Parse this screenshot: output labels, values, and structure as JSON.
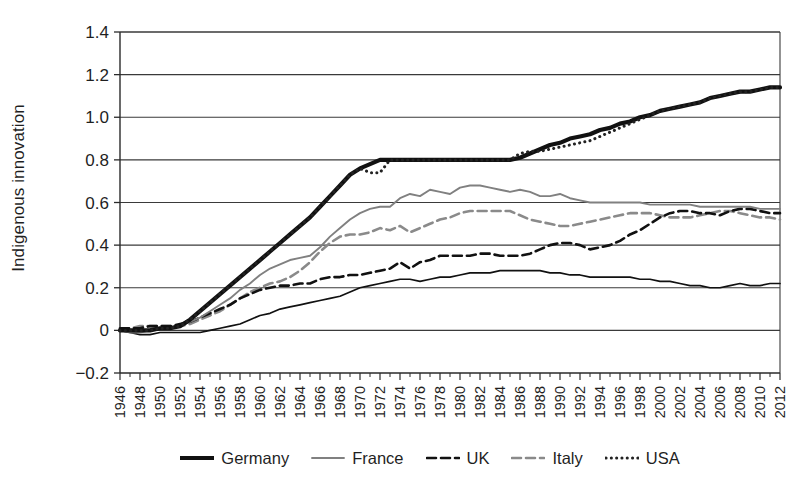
{
  "figure": {
    "ylabel": "Indigenous innovation",
    "y_ticks": [
      "1.4",
      "1.2",
      "1.0",
      "0.8",
      "0.6",
      "0.4",
      "0.2",
      "0",
      "−0.2"
    ],
    "legend": [
      {
        "name": "germany",
        "label": "Germany",
        "style": "solid-thick",
        "color": "#111111"
      },
      {
        "name": "france",
        "label": "France",
        "style": "solid-thin",
        "color": "#808080"
      },
      {
        "name": "uk",
        "label": "UK",
        "style": "dashed",
        "color": "#111111"
      },
      {
        "name": "italy",
        "label": "Italy",
        "style": "dashed",
        "color": "#8a8a8a"
      },
      {
        "name": "usa",
        "label": "USA",
        "style": "dotted",
        "color": "#222222"
      }
    ]
  },
  "chart_data": {
    "type": "line",
    "title": "",
    "xlabel": "",
    "ylabel": "Indigenous innovation",
    "xlim": [
      1946,
      2012
    ],
    "ylim": [
      -0.2,
      1.4
    ],
    "ytick_step": 0.2,
    "grid": "horizontal",
    "legend_position": "bottom",
    "x_tick_step": 2,
    "x": [
      1946,
      1947,
      1948,
      1949,
      1950,
      1951,
      1952,
      1953,
      1954,
      1955,
      1956,
      1957,
      1958,
      1959,
      1960,
      1961,
      1962,
      1963,
      1964,
      1965,
      1966,
      1967,
      1968,
      1969,
      1970,
      1971,
      1972,
      1973,
      1974,
      1975,
      1976,
      1977,
      1978,
      1979,
      1980,
      1981,
      1982,
      1983,
      1984,
      1985,
      1986,
      1987,
      1988,
      1989,
      1990,
      1991,
      1992,
      1993,
      1994,
      1995,
      1996,
      1997,
      1998,
      1999,
      2000,
      2001,
      2002,
      2003,
      2004,
      2005,
      2006,
      2007,
      2008,
      2009,
      2010,
      2011,
      2012
    ],
    "x_tick_labels": [
      "1946",
      "1948",
      "1950",
      "1952",
      "1954",
      "1956",
      "1958",
      "1960",
      "1962",
      "1964",
      "1966",
      "1968",
      "1970",
      "1972",
      "1974",
      "1976",
      "1978",
      "1980",
      "1982",
      "1984",
      "1986",
      "1988",
      "1990",
      "1992",
      "1994",
      "1996",
      "1998",
      "2000",
      "2002",
      "2004",
      "2006",
      "2008",
      "2010",
      "2012"
    ],
    "series": [
      {
        "name": "Germany",
        "style": "solid-thick",
        "color": "#111111",
        "values": [
          0.0,
          0.0,
          0.0,
          0.0,
          0.01,
          0.01,
          0.02,
          0.05,
          0.09,
          0.13,
          0.17,
          0.21,
          0.25,
          0.29,
          0.33,
          0.37,
          0.41,
          0.45,
          0.49,
          0.53,
          0.58,
          0.63,
          0.68,
          0.73,
          0.76,
          0.78,
          0.8,
          0.8,
          0.8,
          0.8,
          0.8,
          0.8,
          0.8,
          0.8,
          0.8,
          0.8,
          0.8,
          0.8,
          0.8,
          0.8,
          0.81,
          0.83,
          0.85,
          0.87,
          0.88,
          0.9,
          0.91,
          0.92,
          0.94,
          0.95,
          0.97,
          0.98,
          1.0,
          1.01,
          1.03,
          1.04,
          1.05,
          1.06,
          1.07,
          1.09,
          1.1,
          1.11,
          1.12,
          1.12,
          1.13,
          1.14,
          1.14
        ]
      },
      {
        "name": "France",
        "style": "solid-thin",
        "color": "#808080",
        "values": [
          0.0,
          -0.01,
          -0.01,
          0.0,
          0.01,
          0.01,
          0.02,
          0.04,
          0.06,
          0.09,
          0.12,
          0.15,
          0.19,
          0.22,
          0.26,
          0.29,
          0.31,
          0.33,
          0.34,
          0.35,
          0.39,
          0.44,
          0.48,
          0.52,
          0.55,
          0.57,
          0.58,
          0.58,
          0.62,
          0.64,
          0.63,
          0.66,
          0.65,
          0.64,
          0.67,
          0.68,
          0.68,
          0.67,
          0.66,
          0.65,
          0.66,
          0.65,
          0.63,
          0.63,
          0.64,
          0.62,
          0.61,
          0.6,
          0.6,
          0.6,
          0.6,
          0.6,
          0.6,
          0.59,
          0.59,
          0.59,
          0.59,
          0.59,
          0.58,
          0.58,
          0.58,
          0.58,
          0.58,
          0.58,
          0.57,
          0.57,
          0.57
        ]
      },
      {
        "name": "UK",
        "style": "dashed",
        "color": "#111111",
        "values": [
          0.01,
          0.01,
          0.01,
          0.02,
          0.02,
          0.02,
          0.03,
          0.04,
          0.06,
          0.08,
          0.1,
          0.12,
          0.15,
          0.17,
          0.19,
          0.2,
          0.21,
          0.21,
          0.22,
          0.22,
          0.24,
          0.25,
          0.25,
          0.26,
          0.26,
          0.27,
          0.28,
          0.29,
          0.32,
          0.29,
          0.32,
          0.33,
          0.35,
          0.35,
          0.35,
          0.35,
          0.36,
          0.36,
          0.35,
          0.35,
          0.35,
          0.36,
          0.38,
          0.4,
          0.41,
          0.41,
          0.4,
          0.38,
          0.39,
          0.4,
          0.42,
          0.45,
          0.47,
          0.5,
          0.53,
          0.55,
          0.56,
          0.56,
          0.55,
          0.55,
          0.54,
          0.56,
          0.57,
          0.57,
          0.56,
          0.55,
          0.55
        ]
      },
      {
        "name": "Italy",
        "style": "dashed",
        "color": "#8a8a8a",
        "values": [
          0.01,
          0.01,
          0.02,
          0.02,
          0.02,
          0.02,
          0.02,
          0.03,
          0.05,
          0.07,
          0.09,
          0.12,
          0.15,
          0.18,
          0.2,
          0.22,
          0.23,
          0.25,
          0.28,
          0.32,
          0.37,
          0.41,
          0.44,
          0.45,
          0.45,
          0.46,
          0.48,
          0.47,
          0.49,
          0.46,
          0.48,
          0.5,
          0.52,
          0.53,
          0.55,
          0.56,
          0.56,
          0.56,
          0.56,
          0.56,
          0.54,
          0.52,
          0.51,
          0.5,
          0.49,
          0.49,
          0.5,
          0.51,
          0.52,
          0.53,
          0.54,
          0.55,
          0.55,
          0.55,
          0.54,
          0.53,
          0.53,
          0.53,
          0.54,
          0.55,
          0.56,
          0.56,
          0.55,
          0.54,
          0.53,
          0.53,
          0.52
        ]
      },
      {
        "name": "USA",
        "style": "dotted",
        "color": "#222222",
        "values": [
          0.0,
          0.0,
          0.0,
          0.0,
          0.01,
          0.01,
          0.02,
          0.05,
          0.09,
          0.13,
          0.17,
          0.21,
          0.25,
          0.29,
          0.33,
          0.37,
          0.41,
          0.45,
          0.49,
          0.53,
          0.58,
          0.63,
          0.68,
          0.73,
          0.76,
          0.74,
          0.74,
          0.8,
          0.8,
          0.8,
          0.8,
          0.8,
          0.8,
          0.8,
          0.8,
          0.8,
          0.8,
          0.8,
          0.8,
          0.8,
          0.83,
          0.84,
          0.84,
          0.85,
          0.86,
          0.87,
          0.88,
          0.89,
          0.91,
          0.93,
          0.95,
          0.97,
          0.99,
          1.01,
          1.03,
          1.04,
          1.05,
          1.06,
          1.07,
          1.09,
          1.1,
          1.11,
          1.12,
          1.12,
          1.13,
          1.14,
          1.14
        ]
      },
      {
        "name": "unlabeled-lower",
        "style": "solid-thin-dark",
        "color": "#111111",
        "values": [
          0.0,
          -0.01,
          -0.02,
          -0.02,
          -0.01,
          -0.01,
          -0.01,
          -0.01,
          -0.01,
          0.0,
          0.01,
          0.02,
          0.03,
          0.05,
          0.07,
          0.08,
          0.1,
          0.11,
          0.12,
          0.13,
          0.14,
          0.15,
          0.16,
          0.18,
          0.2,
          0.21,
          0.22,
          0.23,
          0.24,
          0.24,
          0.23,
          0.24,
          0.25,
          0.25,
          0.26,
          0.27,
          0.27,
          0.27,
          0.28,
          0.28,
          0.28,
          0.28,
          0.28,
          0.27,
          0.27,
          0.26,
          0.26,
          0.25,
          0.25,
          0.25,
          0.25,
          0.25,
          0.24,
          0.24,
          0.23,
          0.23,
          0.22,
          0.21,
          0.21,
          0.2,
          0.2,
          0.21,
          0.22,
          0.21,
          0.21,
          0.22,
          0.22
        ]
      }
    ]
  }
}
